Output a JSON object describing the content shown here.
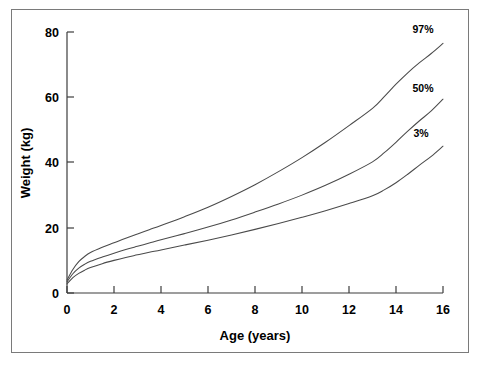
{
  "chart_data": {
    "type": "line",
    "title": "",
    "xlabel": "Age (years)",
    "ylabel": "Weight (kg)",
    "xlim": [
      0,
      16
    ],
    "ylim": [
      0,
      80
    ],
    "xticks": [
      0,
      2,
      4,
      6,
      8,
      10,
      12,
      14,
      16
    ],
    "xtick_labels": [
      "0",
      "2",
      "4",
      "6",
      "8",
      "10",
      "12",
      "14",
      "16"
    ],
    "yticks": [
      0,
      20,
      40,
      60,
      80
    ],
    "ytick_labels": [
      "0",
      "20",
      "40",
      "60",
      "80"
    ],
    "grid": false,
    "legend_position": "inline-right-of-curve-ends",
    "x": [
      0,
      0.25,
      0.5,
      0.75,
      1,
      1.5,
      2,
      2.5,
      3,
      3.5,
      4,
      5,
      6,
      7,
      8,
      9,
      10,
      11,
      12,
      13,
      13.5,
      14,
      14.5,
      15,
      15.5,
      16
    ],
    "series": [
      {
        "name": "97%",
        "label": "97%",
        "color": "#4a4a4a",
        "values": [
          4.0,
          7.2,
          9.6,
          11.2,
          12.4,
          14.0,
          15.4,
          16.8,
          18.1,
          19.4,
          20.7,
          23.4,
          26.3,
          29.6,
          33.2,
          37.2,
          41.5,
          46.2,
          51.3,
          56.6,
          60.2,
          64.0,
          67.5,
          70.6,
          73.4,
          76.5
        ]
      },
      {
        "name": "50%",
        "label": "50%",
        "color": "#4a4a4a",
        "values": [
          3.4,
          5.9,
          7.6,
          8.8,
          9.7,
          11.0,
          12.2,
          13.3,
          14.3,
          15.3,
          16.3,
          18.2,
          20.2,
          22.4,
          24.8,
          27.3,
          30.0,
          33.0,
          36.4,
          40.2,
          43.0,
          46.2,
          49.6,
          52.8,
          55.8,
          59.4
        ]
      },
      {
        "name": "3%",
        "label": "3%",
        "color": "#4a4a4a",
        "values": [
          2.8,
          4.7,
          6.0,
          7.0,
          7.8,
          9.0,
          10.0,
          10.9,
          11.7,
          12.5,
          13.2,
          14.7,
          16.2,
          17.8,
          19.5,
          21.3,
          23.2,
          25.2,
          27.4,
          29.8,
          31.6,
          33.8,
          36.4,
          39.2,
          41.9,
          45.0
        ]
      }
    ]
  },
  "figure": {
    "frame_color": "#7a7a7a",
    "background": "#ffffff",
    "axis_color": "#3d3d3d"
  }
}
